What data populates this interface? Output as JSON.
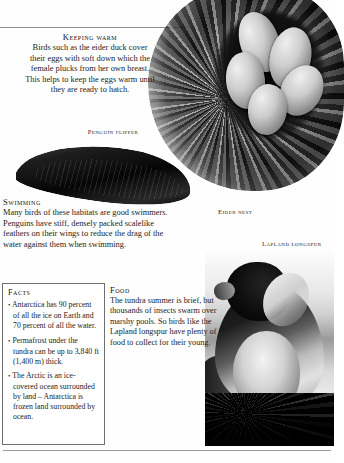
{
  "page": {
    "background_color": "#fefefe",
    "text_color": "#1c1c1c",
    "rule_color": "#8d8d8d"
  },
  "sections": {
    "keeping_warm": {
      "heading": "Keeping warm",
      "body": "Birds such as the eider duck cover their eggs with soft down which the female plucks from her own breast. This helps to keep the eggs warm until they are ready to hatch."
    },
    "swimming": {
      "heading": "Swimming",
      "body": "Many birds of these habitats are good swimmers. Penguins have stiff, densely packed scalelike feathers on their wings to reduce the drag of the water against them when swimming."
    },
    "food": {
      "heading": "Food",
      "body": "The tundra summer is brief, but thousands of insects swarm over marshy pools. So birds like the Lapland longspur have plenty of food to collect for their young."
    },
    "facts": {
      "heading": "Facts",
      "items": [
        "Antarctica has 90 percent of all the ice on Earth and 70 percent of all the water.",
        "Permafrost under the tundra can be up to 3,840 ft (1,400 m) thick.",
        "The Arctic is an ice-covered ocean surrounded by land – Antarctica is frozen land surrounded by ocean."
      ],
      "bullet": "•"
    }
  },
  "captions": {
    "penguin_flipper": "Penguin flipper",
    "eider_nest": "Eider nest",
    "lapland_longspur": "Lapland longspur"
  },
  "photos": {
    "eider_nest": "eider-nest-photo",
    "penguin_flipper": "penguin-flipper-photo",
    "lapland_longspur": "lapland-longspur-photo"
  }
}
